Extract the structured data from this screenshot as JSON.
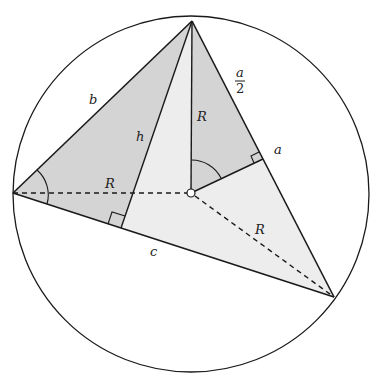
{
  "diagram": {
    "type": "circumscribed-triangle",
    "colors": {
      "stroke": "#1a1a1a",
      "shade_dark": "#d6d6d6",
      "shade_light": "#ececec",
      "background": "#ffffff"
    },
    "labels": {
      "b": "b",
      "h": "h",
      "R_left": "R",
      "R_top": "R",
      "R_right": "R",
      "a": "a",
      "a_half_num": "a",
      "a_half_den": "2",
      "c": "c"
    }
  }
}
